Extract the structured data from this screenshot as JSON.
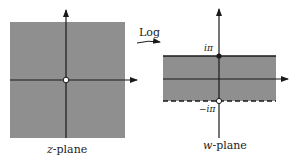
{
  "diagram": {
    "type": "complex-mapping",
    "mapping_label": "Log",
    "colors": {
      "shade": "#8f8f8f",
      "axis": "#1a1a1a",
      "background": "#ffffff"
    },
    "left_panel": {
      "label_var": "z",
      "label_suffix": "-plane",
      "region": "entire plane minus origin (shaded)",
      "origin_marker": "hollow-circle"
    },
    "right_panel": {
      "label_var": "w",
      "label_suffix": "-plane",
      "region": "horizontal strip -iπ < Im w ≤ iπ (shaded)",
      "top_boundary": {
        "label": "iπ",
        "style": "solid",
        "marker": "filled-dot"
      },
      "bottom_boundary": {
        "label": "−iπ",
        "style": "dashed",
        "marker": "hollow-circle"
      }
    }
  }
}
